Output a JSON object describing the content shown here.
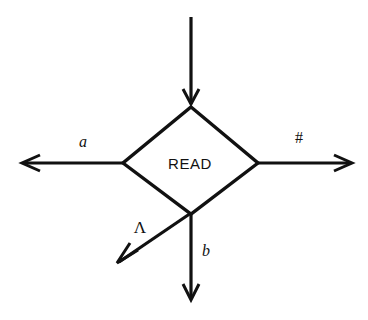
{
  "diagram": {
    "background_color": "#ffffff",
    "stroke_color": "#111111",
    "node": {
      "shape": "diamond",
      "label": "READ",
      "center": {
        "x": 190,
        "y": 163
      },
      "top_vertex": {
        "x": 191,
        "y": 108
      },
      "left_vertex": {
        "x": 122,
        "y": 163
      },
      "right_vertex": {
        "x": 258,
        "y": 163
      },
      "bottom_vertex": {
        "x": 191,
        "y": 213
      }
    },
    "edges": [
      {
        "id": "incoming-top",
        "label": "",
        "direction": "down",
        "from": {
          "x": 191,
          "y": 17
        },
        "to": {
          "x": 191,
          "y": 104
        },
        "arrowhead": "end",
        "label_position": null
      },
      {
        "id": "branch-left-a",
        "label": "a",
        "label_style": "italic",
        "direction": "left",
        "from": {
          "x": 122,
          "y": 163
        },
        "to": {
          "x": 22,
          "y": 163
        },
        "arrowhead": "end",
        "label_position": {
          "x": 83,
          "y": 147
        }
      },
      {
        "id": "branch-right-hash",
        "label": "#",
        "label_style": "plain",
        "direction": "right",
        "from": {
          "x": 258,
          "y": 163
        },
        "to": {
          "x": 352,
          "y": 163
        },
        "arrowhead": "end",
        "label_position": {
          "x": 299,
          "y": 143
        }
      },
      {
        "id": "branch-diagonal-lambda",
        "label": "Λ",
        "label_style": "greek",
        "direction": "down-left",
        "from": {
          "x": 191,
          "y": 213
        },
        "to": {
          "x": 117,
          "y": 263
        },
        "arrowhead": "end",
        "label_position": {
          "x": 140,
          "y": 233
        }
      },
      {
        "id": "branch-bottom-b",
        "label": "b",
        "label_style": "italic",
        "direction": "down",
        "from": {
          "x": 191,
          "y": 213
        },
        "to": {
          "x": 191,
          "y": 300
        },
        "arrowhead": "end",
        "label_position": {
          "x": 203,
          "y": 255
        }
      }
    ]
  }
}
